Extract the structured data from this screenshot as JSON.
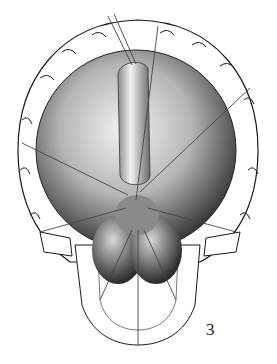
{
  "figure": {
    "number": "3",
    "colors": {
      "ink": "#1a1a1a",
      "shade": "#6b6b6b",
      "light": "#e6e6e6",
      "paper": "#ffffff"
    }
  }
}
